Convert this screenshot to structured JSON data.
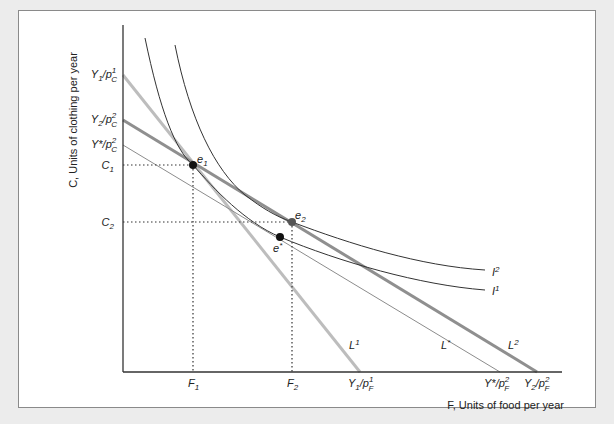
{
  "diagram": {
    "type": "indifference-curve budget-line diagram",
    "y_axis_label": "C, Units of clothing per year",
    "x_axis_label": "F, Units of food per year",
    "y_ticks": [
      {
        "id": "y1pc1",
        "main": "Y",
        "sub1": "1",
        "mid": "/p",
        "sup": "1",
        "sub2": "C"
      },
      {
        "id": "y2pc2",
        "main": "Y",
        "sub1": "2",
        "mid": "/p",
        "sup": "2",
        "sub2": "C"
      },
      {
        "id": "ystarpc2",
        "main": "Y*",
        "sub1": "",
        "mid": "/p",
        "sup": "2",
        "sub2": "C"
      },
      {
        "id": "c1",
        "main": "C",
        "sub1": "1"
      },
      {
        "id": "c2",
        "main": "C",
        "sub1": "2"
      }
    ],
    "x_ticks": [
      {
        "id": "f1",
        "main": "F",
        "sub1": "1"
      },
      {
        "id": "f2",
        "main": "F",
        "sub1": "2"
      },
      {
        "id": "y1pf1",
        "main": "Y",
        "sub1": "1",
        "mid": "/p",
        "sup": "1",
        "sub2": "F"
      },
      {
        "id": "ystarpf2",
        "main": "Y*",
        "sub1": "",
        "mid": "/p",
        "sup": "2",
        "sub2": "F"
      },
      {
        "id": "y2pf2",
        "main": "Y",
        "sub1": "2",
        "mid": "/p",
        "sup": "2",
        "sub2": "F"
      }
    ],
    "points": [
      {
        "label": "e",
        "sub": "1",
        "color": "#111111"
      },
      {
        "label": "e",
        "sup": "*",
        "color": "#111111"
      },
      {
        "label": "e",
        "sub": "2",
        "color": "#555555"
      }
    ],
    "lines": [
      {
        "label": "L",
        "sup": "1",
        "color": "#b8b8b8"
      },
      {
        "label": "L",
        "sup": "*",
        "color": "#888888"
      },
      {
        "label": "L",
        "sup": "2",
        "color": "#8a8a8a"
      }
    ],
    "curves": [
      {
        "label": "I",
        "sup": "1",
        "color": "#333333"
      },
      {
        "label": "I",
        "sup": "2",
        "color": "#333333"
      }
    ]
  }
}
